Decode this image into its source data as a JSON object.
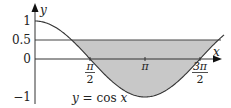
{
  "chart_data": {
    "type": "area",
    "title": "",
    "function_label": "y = cos x",
    "xlabel": "x",
    "ylabel": "y",
    "x_ticks": [
      {
        "value": 1.5708,
        "num": "π",
        "den": "2"
      },
      {
        "value": 3.1416,
        "num": "π",
        "den": ""
      },
      {
        "value": 4.7124,
        "num": "3π",
        "den": "2"
      }
    ],
    "y_ticks": [
      {
        "value": 1,
        "label": "1"
      },
      {
        "value": 0.5,
        "label": "0.5"
      },
      {
        "value": 0,
        "label": "0"
      },
      {
        "value": -1,
        "label": "−1"
      }
    ],
    "xlim": [
      0,
      5.3
    ],
    "ylim": [
      -1,
      1.1
    ],
    "series": [
      {
        "name": "y = cos x",
        "x_start": 0,
        "x_end": 5.3,
        "color": "#333333"
      }
    ],
    "reference_line": {
      "y": 0.5,
      "color": "#444444"
    },
    "shaded_region": {
      "description": "region between y = 0.5 and y = cos x where cos x < 0.5",
      "x_from": 1.0472,
      "x_to": 5.236,
      "fill": "#c8c8c8"
    },
    "grid": false,
    "legend": null
  }
}
